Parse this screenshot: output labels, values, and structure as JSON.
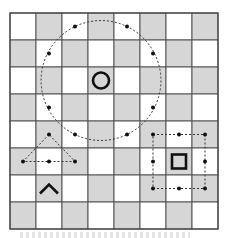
{
  "diagram": {
    "type": "chessboard-move-diagram",
    "board": {
      "columns": 8,
      "rows": 8,
      "dark_parity": "odd",
      "light_color": "#ffffff",
      "dark_color": "#d6d6d6",
      "line_color": "#555555"
    },
    "pieces": [
      {
        "name": "circle-piece",
        "symbol": "circle",
        "col": 3,
        "row": 2
      },
      {
        "name": "caret-piece",
        "symbol": "caret",
        "col": 1,
        "row": 6
      },
      {
        "name": "square-piece",
        "symbol": "square",
        "col": 6,
        "row": 5
      }
    ],
    "move_patterns": [
      {
        "name": "circle-move-ring",
        "shape": "circle",
        "center": [
          3,
          2
        ],
        "targets": [
          [
            2,
            0
          ],
          [
            4,
            0
          ],
          [
            1,
            1
          ],
          [
            5,
            1
          ],
          [
            1,
            3
          ],
          [
            5,
            3
          ],
          [
            2,
            4
          ],
          [
            4,
            4
          ]
        ]
      },
      {
        "name": "caret-move-triangle",
        "shape": "triangle",
        "vertices": [
          [
            1,
            4
          ],
          [
            0,
            5
          ],
          [
            2,
            5
          ]
        ],
        "targets": [
          [
            1,
            4
          ],
          [
            0,
            5
          ],
          [
            1,
            5
          ],
          [
            2,
            5
          ]
        ]
      },
      {
        "name": "square-move-box",
        "shape": "box",
        "corners": [
          [
            5,
            4
          ],
          [
            7,
            6
          ]
        ],
        "targets": [
          [
            5,
            4
          ],
          [
            6,
            4
          ],
          [
            7,
            4
          ],
          [
            5,
            5
          ],
          [
            7,
            5
          ],
          [
            5,
            6
          ],
          [
            6,
            6
          ],
          [
            7,
            6
          ]
        ]
      }
    ]
  }
}
